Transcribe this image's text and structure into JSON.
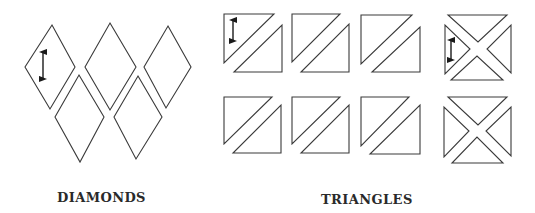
{
  "labels": {
    "diamonds": "DIAMONDS",
    "triangles": "TRIANGLES"
  },
  "colors": {
    "stroke": "#3a3a3a",
    "arrow": "#1a1a1a",
    "text": "#2a2a2a",
    "background": "#ffffff"
  },
  "diamonds": [
    {
      "points": "52,25 75,67 50,109 25,67",
      "grain_arrow": {
        "x": 43,
        "y1": 50,
        "y2": 81
      }
    },
    {
      "points": "110,23 136,67 110,110 85,67"
    },
    {
      "points": "168,26 191,67 166,108 144,67"
    },
    {
      "points": "79,75 104,117 80,162 55,117"
    },
    {
      "points": "138,76 162,117 136,159 114,117"
    }
  ],
  "half_square_triangles": [
    {
      "upper": "224,14 274,14 224,63",
      "lower": "282,25 282,72 234,72",
      "grain_arrow": {
        "x": 233,
        "y1": 18,
        "y2": 43
      }
    },
    {
      "upper": "292,14 340,14 292,62",
      "lower": "349,24 349,72 301,72"
    },
    {
      "upper": "361,15 412,15 361,64",
      "lower": "420,27 420,72 372,72"
    },
    {
      "upper": "224,97 272,97 224,144",
      "lower": "281,105 281,153 233,153"
    },
    {
      "upper": "292,97 340,97 292,144",
      "lower": "349,105 349,153 301,153"
    },
    {
      "upper": "361,97 409,97 361,146",
      "lower": "420,105 420,154 370,154"
    }
  ],
  "quarter_square_triangles": [
    {
      "top": "448,15 507,15 478,42",
      "left": "445,25 445,74 470,49",
      "right": "511,25 511,73 487,49",
      "bottom": "451,80 503,80 477,56",
      "grain_arrow": {
        "x": 451,
        "y1": 38,
        "y2": 62
      }
    },
    {
      "top": "448,97 507,97 478,125",
      "left": "444,107 444,157 469,131",
      "right": "511,107 511,156 486,131",
      "bottom": "452,163 503,163 477,137"
    }
  ]
}
